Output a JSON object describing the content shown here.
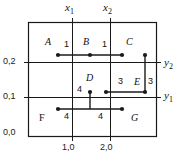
{
  "diagram": {
    "frame": {
      "left": 28,
      "top": 22,
      "right": 157,
      "bottom": 137
    },
    "axes": {
      "y_tick_labels": [
        "0,2",
        "0,1",
        "0,0"
      ],
      "y_tick_y": [
        62,
        97,
        133
      ],
      "x_tick_labels": [
        "1,0",
        "2,0"
      ],
      "x_tick_x": [
        72,
        110
      ],
      "x_vars": [
        {
          "name": "x",
          "sub": "1",
          "x": 72
        },
        {
          "name": "x",
          "sub": "2",
          "x": 110
        }
      ],
      "y_vars": [
        {
          "name": "y",
          "sub": "2",
          "y": 65
        },
        {
          "name": "y",
          "sub": "1",
          "y": 98
        }
      ]
    },
    "gridlines": {
      "vertical_x": [
        72,
        110
      ],
      "horizontal_y": [
        62,
        97
      ]
    },
    "regions": [
      {
        "label": "A",
        "x": 48,
        "y": 44,
        "italic": true
      },
      {
        "label": "B",
        "x": 86,
        "y": 44,
        "italic": true
      },
      {
        "label": "C",
        "x": 128,
        "y": 44,
        "italic": true
      },
      {
        "label": "D",
        "x": 88,
        "y": 80,
        "italic": true
      },
      {
        "label": "E",
        "x": 137,
        "y": 84,
        "italic": true
      },
      {
        "label": "F",
        "x": 42,
        "y": 118,
        "italic": false
      },
      {
        "label": "G",
        "x": 134,
        "y": 118,
        "italic": true
      }
    ],
    "edges": [
      {
        "from": "A",
        "to": "B",
        "weight": "1",
        "label_x": 66,
        "label_y": 44
      },
      {
        "from": "B",
        "to": "C",
        "weight": "1",
        "label_x": 104,
        "label_y": 44
      },
      {
        "from": "C",
        "to": "E",
        "weight": "3",
        "label_x": 150,
        "label_y": 80
      },
      {
        "from": "D",
        "to": "E",
        "weight": "3",
        "label_x": 120,
        "label_y": 80
      },
      {
        "from": "D",
        "to": "F",
        "weight": "4",
        "label_x": 79,
        "label_y": 88
      },
      {
        "from": "F",
        "to": "G",
        "weight": "4",
        "label_x": 66,
        "label_y": 117
      },
      {
        "from": "F",
        "to": "G",
        "weight": "4",
        "label_x": 100,
        "label_y": 117
      }
    ],
    "nodes": [
      {
        "id": "A",
        "cx": 58,
        "cy": 55
      },
      {
        "id": "B",
        "cx": 90,
        "cy": 55
      },
      {
        "id": "C",
        "cx": 122,
        "cy": 55
      },
      {
        "id": "C2",
        "cx": 145,
        "cy": 55
      },
      {
        "id": "E",
        "cx": 145,
        "cy": 92
      },
      {
        "id": "D",
        "cx": 106,
        "cy": 92
      },
      {
        "id": "D2",
        "cx": 90,
        "cy": 92
      },
      {
        "id": "F",
        "cx": 58,
        "cy": 109
      },
      {
        "id": "G",
        "cx": 122,
        "cy": 109
      }
    ],
    "colors": {
      "stroke": "#1a1a1a",
      "background": "#ffffff"
    }
  }
}
